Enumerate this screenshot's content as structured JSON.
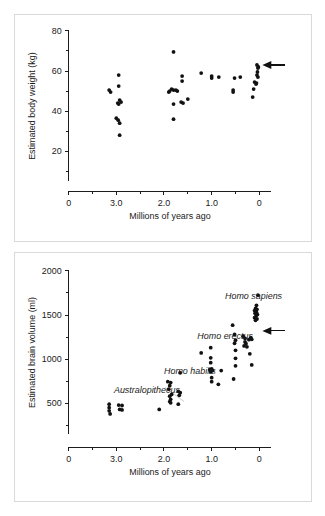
{
  "figure": {
    "panels": [
      {
        "id": "body-weight",
        "ylabel": "Estimated body weight (kg)",
        "xlabel": "Millions of years ago"
      },
      {
        "id": "brain-volume",
        "ylabel": "Estimated brain volume (ml)",
        "xlabel": "Millions of years ago"
      }
    ]
  },
  "chart_data": [
    {
      "type": "scatter",
      "title": "",
      "xlabel": "Millions of years ago",
      "ylabel": "Estimated body weight (kg)",
      "xlim": [
        4.0,
        -0.25
      ],
      "ylim": [
        0,
        80
      ],
      "x_reversed": true,
      "grid": false,
      "legend": null,
      "x_ticks": [
        4.0,
        3.0,
        2.0,
        1.0,
        0.0
      ],
      "x_tick_labels": [
        "0",
        "3.0",
        "2.0",
        "1.0",
        "0"
      ],
      "x_minor_ticks": [
        3.5,
        2.5,
        1.5,
        0.5
      ],
      "y_ticks": [
        20,
        40,
        60,
        80
      ],
      "y_tick_labels": [
        "20",
        "40",
        "60",
        "80"
      ],
      "y_minor_ticks": [
        10,
        30,
        50,
        70
      ],
      "y_axis_min_draw": 5,
      "points": [
        {
          "x": 3.15,
          "y": 50.5
        },
        {
          "x": 3.12,
          "y": 49.5
        },
        {
          "x": 2.95,
          "y": 58.0
        },
        {
          "x": 2.95,
          "y": 52.5
        },
        {
          "x": 2.93,
          "y": 45.5
        },
        {
          "x": 2.9,
          "y": 44.5
        },
        {
          "x": 2.97,
          "y": 44.0
        },
        {
          "x": 2.95,
          "y": 43.5
        },
        {
          "x": 3.0,
          "y": 36.5
        },
        {
          "x": 2.96,
          "y": 35.5
        },
        {
          "x": 2.93,
          "y": 34.0
        },
        {
          "x": 2.93,
          "y": 28.0
        },
        {
          "x": 1.8,
          "y": 69.5
        },
        {
          "x": 1.8,
          "y": 36.0
        },
        {
          "x": 1.62,
          "y": 57.5
        },
        {
          "x": 1.62,
          "y": 55.0
        },
        {
          "x": 1.84,
          "y": 51.0
        },
        {
          "x": 1.8,
          "y": 50.5
        },
        {
          "x": 1.75,
          "y": 50.5
        },
        {
          "x": 1.72,
          "y": 50.0
        },
        {
          "x": 1.88,
          "y": 50.0
        },
        {
          "x": 1.9,
          "y": 49.5
        },
        {
          "x": 1.8,
          "y": 43.5
        },
        {
          "x": 1.64,
          "y": 44.5
        },
        {
          "x": 1.6,
          "y": 44.0
        },
        {
          "x": 1.5,
          "y": 46.0
        },
        {
          "x": 1.22,
          "y": 59.0
        },
        {
          "x": 1.0,
          "y": 57.5
        },
        {
          "x": 1.0,
          "y": 56.5
        },
        {
          "x": 0.85,
          "y": 57.0
        },
        {
          "x": 0.52,
          "y": 56.5
        },
        {
          "x": 0.4,
          "y": 57.0
        },
        {
          "x": 0.55,
          "y": 50.5
        },
        {
          "x": 0.55,
          "y": 49.5
        },
        {
          "x": 0.05,
          "y": 63.0
        },
        {
          "x": 0.02,
          "y": 62.0
        },
        {
          "x": 0.03,
          "y": 61.5
        },
        {
          "x": 0.04,
          "y": 59.5
        },
        {
          "x": 0.05,
          "y": 58.0
        },
        {
          "x": 0.03,
          "y": 57.0
        },
        {
          "x": 0.1,
          "y": 54.5
        },
        {
          "x": 0.06,
          "y": 54.0
        },
        {
          "x": 0.07,
          "y": 53.5
        },
        {
          "x": 0.12,
          "y": 51.0
        },
        {
          "x": 0.14,
          "y": 47.0
        }
      ],
      "annotations": [
        {
          "kind": "arrow",
          "label": "modern-human-weight-marker",
          "x": 0.02,
          "y": 63.0,
          "direction": "left"
        }
      ]
    },
    {
      "type": "scatter",
      "title": "",
      "xlabel": "Millions of years ago",
      "ylabel": "Estimated brain volume (ml)",
      "xlim": [
        4.0,
        -0.25
      ],
      "ylim": [
        0,
        2000
      ],
      "x_reversed": true,
      "grid": false,
      "legend": null,
      "x_ticks": [
        4.0,
        3.0,
        2.0,
        1.0,
        0.0
      ],
      "x_tick_labels": [
        "0",
        "3.0",
        "2.0",
        "1.0",
        "0"
      ],
      "x_minor_ticks": [
        3.5,
        2.5,
        1.5,
        0.5
      ],
      "y_ticks": [
        500,
        1000,
        1500,
        2000
      ],
      "y_tick_labels": [
        "500",
        "1000",
        "1500",
        "2000"
      ],
      "y_minor_ticks": [
        250,
        750,
        1250,
        1750
      ],
      "y_axis_min_draw": 150,
      "points": [
        {
          "x": 3.15,
          "y": 490
        },
        {
          "x": 3.15,
          "y": 450
        },
        {
          "x": 3.15,
          "y": 415
        },
        {
          "x": 3.13,
          "y": 380
        },
        {
          "x": 2.95,
          "y": 480
        },
        {
          "x": 2.88,
          "y": 475
        },
        {
          "x": 2.93,
          "y": 430
        },
        {
          "x": 2.88,
          "y": 425
        },
        {
          "x": 2.1,
          "y": 430
        },
        {
          "x": 1.92,
          "y": 745
        },
        {
          "x": 1.86,
          "y": 735
        },
        {
          "x": 1.88,
          "y": 700
        },
        {
          "x": 1.9,
          "y": 660
        },
        {
          "x": 1.84,
          "y": 600
        },
        {
          "x": 1.88,
          "y": 580
        },
        {
          "x": 1.86,
          "y": 545
        },
        {
          "x": 1.88,
          "y": 520
        },
        {
          "x": 1.86,
          "y": 505
        },
        {
          "x": 1.66,
          "y": 845
        },
        {
          "x": 1.7,
          "y": 635
        },
        {
          "x": 1.66,
          "y": 620
        },
        {
          "x": 1.68,
          "y": 590
        },
        {
          "x": 1.7,
          "y": 490
        },
        {
          "x": 1.22,
          "y": 1070
        },
        {
          "x": 1.02,
          "y": 1130
        },
        {
          "x": 1.02,
          "y": 1015
        },
        {
          "x": 1.02,
          "y": 960
        },
        {
          "x": 1.0,
          "y": 890
        },
        {
          "x": 1.04,
          "y": 880
        },
        {
          "x": 0.98,
          "y": 870
        },
        {
          "x": 1.02,
          "y": 855
        },
        {
          "x": 1.0,
          "y": 790
        },
        {
          "x": 1.0,
          "y": 745
        },
        {
          "x": 0.86,
          "y": 715
        },
        {
          "x": 0.8,
          "y": 870
        },
        {
          "x": 0.56,
          "y": 1385
        },
        {
          "x": 0.52,
          "y": 1280
        },
        {
          "x": 0.5,
          "y": 1215
        },
        {
          "x": 0.52,
          "y": 1180
        },
        {
          "x": 0.5,
          "y": 1100
        },
        {
          "x": 0.5,
          "y": 1010
        },
        {
          "x": 0.5,
          "y": 925
        },
        {
          "x": 0.54,
          "y": 775
        },
        {
          "x": 0.34,
          "y": 1260
        },
        {
          "x": 0.3,
          "y": 1235
        },
        {
          "x": 0.3,
          "y": 1195
        },
        {
          "x": 0.28,
          "y": 1175
        },
        {
          "x": 0.32,
          "y": 1150
        },
        {
          "x": 0.26,
          "y": 1140
        },
        {
          "x": 0.22,
          "y": 1220
        },
        {
          "x": 0.18,
          "y": 1245
        },
        {
          "x": 0.16,
          "y": 1225
        },
        {
          "x": 0.2,
          "y": 1060
        },
        {
          "x": 0.16,
          "y": 935
        },
        {
          "x": 0.03,
          "y": 1725
        },
        {
          "x": 0.06,
          "y": 1610
        },
        {
          "x": 0.08,
          "y": 1575
        },
        {
          "x": 0.05,
          "y": 1565
        },
        {
          "x": 0.1,
          "y": 1550
        },
        {
          "x": 0.06,
          "y": 1530
        },
        {
          "x": 0.09,
          "y": 1520
        },
        {
          "x": 0.04,
          "y": 1505
        },
        {
          "x": 0.07,
          "y": 1490
        },
        {
          "x": 0.1,
          "y": 1470
        },
        {
          "x": 0.05,
          "y": 1455
        },
        {
          "x": 0.08,
          "y": 1440
        }
      ],
      "annotations": [
        {
          "kind": "arrow",
          "label": "modern-human-brain-marker",
          "x": 0.02,
          "y": 1320,
          "direction": "left"
        },
        {
          "kind": "text",
          "label": "Australopithecus",
          "x": 3.05,
          "y": 620,
          "style": "italic"
        },
        {
          "kind": "text",
          "label": "Homo habilis",
          "x": 2.0,
          "y": 830,
          "style": "italic"
        },
        {
          "kind": "text",
          "label": "Homo erectus",
          "x": 1.3,
          "y": 1230,
          "style": "italic"
        },
        {
          "kind": "text",
          "label": "Homo sapiens",
          "x": 0.72,
          "y": 1680,
          "style": "italic"
        }
      ],
      "trend_line": {
        "x1": 1.98,
        "y1": 680,
        "x2": 1.58,
        "y2": 520
      }
    }
  ]
}
